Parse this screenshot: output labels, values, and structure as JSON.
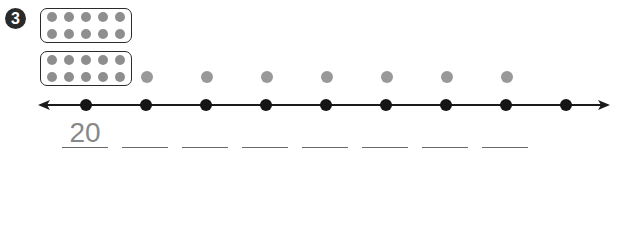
{
  "problem": {
    "number": "3",
    "ten_frames": [
      {
        "rows": 2,
        "cols": 5,
        "count": 10
      },
      {
        "rows": 2,
        "cols": 5,
        "count": 10
      }
    ],
    "extra_dots_above_line": 7,
    "number_line": {
      "tick_points": 9,
      "arrows": "both"
    },
    "blanks": [
      {
        "value": "20"
      },
      {
        "value": ""
      },
      {
        "value": ""
      },
      {
        "value": ""
      },
      {
        "value": ""
      },
      {
        "value": ""
      },
      {
        "value": ""
      },
      {
        "value": ""
      }
    ]
  },
  "colors": {
    "badge": "#2a2a2a",
    "frame_dot": "#8e8e8e",
    "loose_dot": "#999999",
    "line_dot": "#151515",
    "answer_text": "#888888"
  }
}
